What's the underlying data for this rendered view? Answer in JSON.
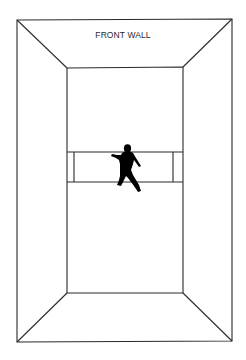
{
  "diagram": {
    "title": "FRONT WALL",
    "colors": {
      "line": "#2a2a2a",
      "background": "#ffffff",
      "figure": "#000000"
    },
    "elements": {
      "outer_walls": {
        "x1": 17,
        "y1": 20,
        "x2": 232,
        "y2": 341
      },
      "floor": {
        "x1": 67,
        "y1": 68,
        "x2": 183,
        "y2": 293
      },
      "service_zone": {
        "y_top": 152,
        "y_bottom": 182,
        "left_line_x": 74,
        "right_line_x": 173
      },
      "player": {
        "pose": "running",
        "x": 128,
        "y": 170
      }
    }
  }
}
